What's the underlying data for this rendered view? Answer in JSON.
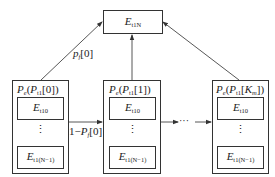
{
  "diagram": {
    "top_node": {
      "label_main": "E",
      "label_sub": "t1N"
    },
    "columns": [
      {
        "id": "col-0",
        "header_main": "P",
        "header_sub": "e",
        "header_arg_main": "P",
        "header_arg_sub": "t1",
        "header_index": "[0]",
        "first_entry": {
          "main": "E",
          "sub": "t10"
        },
        "last_entry": {
          "main": "E",
          "sub": "t1(N−1)"
        },
        "ellipsis": "⋮"
      },
      {
        "id": "col-1",
        "header_main": "P",
        "header_sub": "e",
        "header_arg_main": "P",
        "header_arg_sub": "t1",
        "header_index": "[1]",
        "first_entry": {
          "main": "E",
          "sub": "t10"
        },
        "last_entry": {
          "main": "E",
          "sub": "t1(N−1)"
        },
        "ellipsis": "⋮"
      },
      {
        "id": "col-K",
        "header_main": "P",
        "header_sub": "e",
        "header_arg_main": "P",
        "header_arg_sub": "t1",
        "header_index_prefix": "[",
        "header_index_main": "K",
        "header_index_sub": "m",
        "header_index_suffix": "]",
        "first_entry": {
          "main": "E",
          "sub": "t10"
        },
        "last_entry": {
          "main": "E",
          "sub": "t1(N−1)"
        },
        "ellipsis": "⋮"
      }
    ],
    "edges": {
      "to_top_label_main": "p",
      "to_top_label_sub": "f",
      "to_top_label_index": "[0]",
      "horizontal_label_prefix": "1−",
      "horizontal_label_main": "P",
      "horizontal_label_sub": "f",
      "horizontal_label_index": "[0]",
      "chain_ellipsis": "···"
    }
  }
}
